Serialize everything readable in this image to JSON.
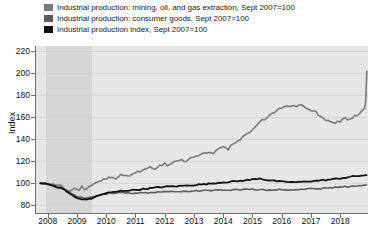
{
  "legend": {
    "position": "top-left",
    "items": [
      {
        "label": "Industrial production: mining, oil, and gas extraction, Sept 2007=100",
        "color": "#7a7a7a",
        "swatch_name": "legend-swatch-mining"
      },
      {
        "label": "Industrial production: consumer goods, Sept 2007=100",
        "color": "#5c5c5c",
        "swatch_name": "legend-swatch-consumer"
      },
      {
        "label": "Industrial production index, Sept 2007=100",
        "color": "#111111",
        "swatch_name": "legend-swatch-index"
      }
    ]
  },
  "axes": {
    "ylabel": "Index",
    "xlabel": "",
    "yticks": [
      "220",
      "200",
      "180",
      "160",
      "140",
      "120",
      "100",
      "80"
    ],
    "xticks": [
      "2008",
      "2009",
      "2010",
      "2011",
      "2012",
      "2013",
      "2014",
      "2015",
      "2016",
      "2017",
      "2018"
    ]
  },
  "colors": {
    "plot_background": "#e6e6e6",
    "recession_band": "#d6d6d6",
    "gridline": "#cfcfcf",
    "axis": "#6e6e6e",
    "text": "#111111"
  },
  "annotations": {
    "recession_label": "",
    "recession_start": "2008.0",
    "recession_end": "2009.5"
  },
  "chart_data": {
    "type": "line",
    "title": "",
    "subtitle": "",
    "xlabel": "",
    "ylabel": "Index",
    "xlim": [
      2007.6,
      2018.95
    ],
    "ylim": [
      73,
      225
    ],
    "grid": true,
    "legend_position": "above-plot-left",
    "shaded_regions": [
      {
        "name": "recession",
        "x_start": 2007.95,
        "x_end": 2009.5,
        "color": "#d6d6d6"
      }
    ],
    "x_tick_values": [
      2008,
      2009,
      2010,
      2011,
      2012,
      2013,
      2014,
      2015,
      2016,
      2017,
      2018
    ],
    "y_tick_values": [
      80,
      100,
      120,
      140,
      160,
      180,
      200,
      220
    ],
    "series": [
      {
        "name": "Industrial production: mining, oil, and gas extraction, Sept 2007=100",
        "color": "#7a7a7a",
        "width": 1.6,
        "x": [
          2007.75,
          2007.92,
          2008.08,
          2008.25,
          2008.42,
          2008.58,
          2008.75,
          2008.92,
          2009.08,
          2009.17,
          2009.25,
          2009.33,
          2009.5,
          2009.67,
          2009.83,
          2010.0,
          2010.17,
          2010.33,
          2010.5,
          2010.67,
          2010.83,
          2011.0,
          2011.17,
          2011.33,
          2011.5,
          2011.67,
          2011.83,
          2012.0,
          2012.17,
          2012.33,
          2012.5,
          2012.67,
          2012.83,
          2013.0,
          2013.17,
          2013.33,
          2013.5,
          2013.67,
          2013.83,
          2014.0,
          2014.17,
          2014.33,
          2014.5,
          2014.67,
          2014.83,
          2015.0,
          2015.17,
          2015.33,
          2015.5,
          2015.67,
          2015.83,
          2016.0,
          2016.17,
          2016.33,
          2016.5,
          2016.67,
          2016.83,
          2017.0,
          2017.17,
          2017.33,
          2017.5,
          2017.67,
          2017.83,
          2018.0,
          2018.17,
          2018.33,
          2018.5,
          2018.67,
          2018.83
        ],
        "y": [
          100.5,
          100.0,
          99.0,
          98.5,
          97.5,
          95.0,
          92.0,
          96.5,
          94.0,
          97.0,
          93.5,
          95.5,
          98.0,
          100.5,
          103.0,
          104.5,
          106.0,
          105.0,
          107.5,
          108.0,
          107.0,
          109.5,
          111.0,
          112.5,
          114.0,
          113.0,
          116.0,
          117.5,
          116.5,
          119.0,
          121.5,
          120.0,
          122.5,
          124.0,
          126.0,
          127.5,
          129.0,
          128.0,
          131.0,
          133.5,
          130.5,
          136.0,
          139.0,
          142.0,
          145.0,
          149.0,
          153.0,
          157.0,
          160.0,
          163.0,
          166.0,
          168.5,
          169.5,
          171.0,
          170.0,
          171.5,
          169.0,
          167.0,
          164.5,
          161.0,
          158.0,
          156.5,
          155.0,
          157.0,
          159.0,
          158.0,
          161.0,
          164.0,
          167.0
        ],
        "note": "values continue to 202 at end of 2018"
      },
      {
        "name": "Industrial production: consumer goods, Sept 2007=100",
        "color": "#5c5c5c",
        "width": 1.6,
        "x": [
          2007.75,
          2008.0,
          2008.25,
          2008.5,
          2008.75,
          2009.0,
          2009.25,
          2009.5,
          2009.75,
          2010.0,
          2010.5,
          2011.0,
          2011.5,
          2012.0,
          2012.5,
          2013.0,
          2013.5,
          2014.0,
          2014.5,
          2015.0,
          2015.5,
          2016.0,
          2016.5,
          2017.0,
          2017.5,
          2018.0,
          2018.5,
          2018.9
        ],
        "y": [
          100.0,
          99.0,
          97.0,
          95.0,
          92.0,
          88.0,
          86.5,
          87.5,
          89.0,
          90.5,
          91.5,
          91.0,
          91.5,
          92.5,
          92.0,
          93.0,
          93.5,
          94.0,
          94.0,
          94.5,
          94.0,
          94.5,
          94.0,
          95.0,
          95.5,
          96.5,
          97.5,
          98.5
        ]
      },
      {
        "name": "Industrial production index, Sept 2007=100",
        "color": "#111111",
        "width": 1.8,
        "x": [
          2007.75,
          2008.0,
          2008.25,
          2008.5,
          2008.75,
          2009.0,
          2009.25,
          2009.5,
          2009.75,
          2010.0,
          2010.5,
          2011.0,
          2011.5,
          2012.0,
          2012.5,
          2013.0,
          2013.5,
          2014.0,
          2014.5,
          2015.0,
          2015.25,
          2015.5,
          2016.0,
          2016.5,
          2017.0,
          2017.5,
          2018.0,
          2018.5,
          2018.9
        ],
        "y": [
          100.3,
          99.5,
          97.5,
          95.0,
          91.0,
          86.5,
          85.0,
          86.5,
          89.0,
          91.0,
          93.0,
          94.0,
          95.5,
          97.0,
          97.5,
          98.5,
          99.5,
          101.0,
          102.0,
          103.5,
          104.5,
          103.0,
          101.5,
          101.0,
          102.0,
          103.0,
          104.5,
          106.5,
          107.5
        ]
      }
    ]
  }
}
